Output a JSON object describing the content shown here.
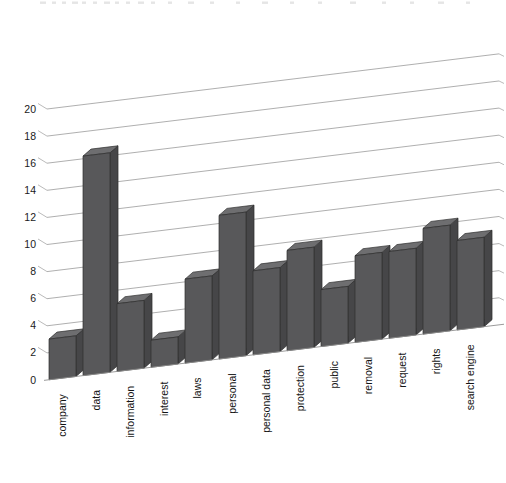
{
  "chart_data": {
    "type": "bar",
    "title": "",
    "subtitle": "",
    "xlabel": "",
    "ylabel": "",
    "ylim": [
      0,
      20
    ],
    "y_ticks": [
      0,
      2,
      4,
      6,
      8,
      10,
      12,
      14,
      16,
      18,
      20
    ],
    "grid": true,
    "legend": "none",
    "style": "3d-perspective",
    "bar_color": "#58585a",
    "bar_side_color": "#464648",
    "bar_top_color": "#6e6e70",
    "gridline_color": "#9a9a9a",
    "background": "#ffffff",
    "categories": [
      "company",
      "data",
      "information",
      "interest",
      "laws",
      "personal",
      "personal data",
      "protection",
      "public",
      "removal",
      "request",
      "rights",
      "search engine"
    ],
    "values": [
      3.0,
      16.2,
      5.0,
      2.0,
      6.2,
      10.6,
      6.2,
      7.4,
      4.2,
      6.4,
      6.4,
      7.8,
      6.6
    ],
    "series": [
      {
        "name": "frequency",
        "values": [
          3.0,
          16.2,
          5.0,
          2.0,
          6.2,
          10.6,
          6.2,
          7.4,
          4.2,
          6.4,
          6.4,
          7.8,
          6.6
        ]
      }
    ]
  },
  "axis": {
    "y_tick_labels": [
      "20",
      "18",
      "16",
      "14",
      "12",
      "10",
      "8",
      "6",
      "4",
      "2",
      "0"
    ]
  }
}
